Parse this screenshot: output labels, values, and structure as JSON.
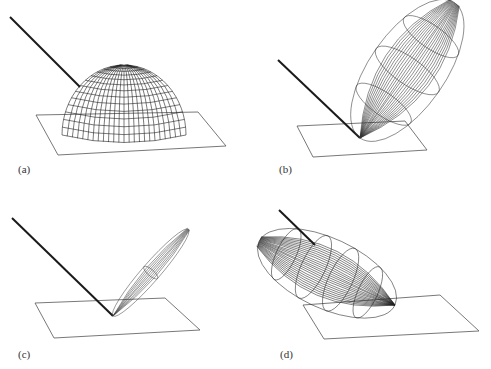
{
  "figure": {
    "panels": [
      {
        "id": "a",
        "label": "(a)",
        "lobe": "diffuse hemisphere"
      },
      {
        "id": "b",
        "label": "(b)",
        "lobe": "broad specular lobe"
      },
      {
        "id": "c",
        "label": "(c)",
        "lobe": "narrow specular lobe"
      },
      {
        "id": "d",
        "label": "(d)",
        "lobe": "back-scatter lobe"
      }
    ]
  },
  "colors": {
    "line": "#222222",
    "plane": "#555555",
    "ray": "#1a1a1a"
  }
}
